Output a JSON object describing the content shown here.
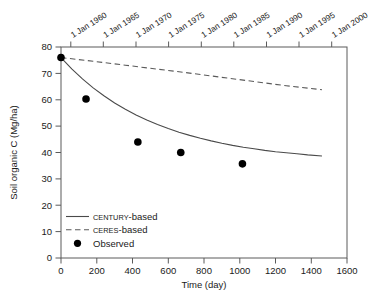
{
  "chart_data": {
    "type": "line",
    "title": "",
    "xlabel": "Time (day)",
    "ylabel": "Soil organic C (Mg/ha)",
    "xlim": [
      0,
      1600
    ],
    "ylim": [
      0,
      80
    ],
    "xticks": [
      0,
      200,
      400,
      600,
      800,
      1000,
      1200,
      1400,
      1600
    ],
    "yticks": [
      0,
      10,
      20,
      30,
      40,
      50,
      60,
      70,
      80
    ],
    "grid": false,
    "secondary_xaxis": {
      "label": "",
      "position": "top",
      "tick_labels": [
        "1 Jan 1960",
        "1 Jan 1965",
        "1 Jan 1970",
        "1 Jan 1975",
        "1 Jan 1980",
        "1 Jan 1985",
        "1 Jan 1990",
        "1 Jan 1995",
        "1 Jan 2000"
      ],
      "tick_days": [
        55,
        237,
        420,
        602,
        785,
        967,
        1150,
        1332,
        1515
      ]
    },
    "legend_position": "lower left",
    "series": [
      {
        "name": "CENTURY-based",
        "style": "solid",
        "x": [
          0,
          60,
          120,
          180,
          240,
          300,
          360,
          420,
          480,
          540,
          600,
          660,
          720,
          780,
          840,
          900,
          960,
          1020,
          1080,
          1140,
          1200,
          1260,
          1320,
          1380,
          1460
        ],
        "values": [
          76.0,
          71.7,
          67.9,
          64.5,
          61.5,
          58.8,
          56.4,
          54.2,
          52.3,
          50.6,
          49.1,
          47.7,
          46.5,
          45.4,
          44.4,
          43.5,
          42.7,
          42.0,
          41.4,
          40.8,
          40.3,
          39.9,
          39.5,
          39.1,
          38.7
        ]
      },
      {
        "name": "CERES-based",
        "style": "dashed",
        "x": [
          0,
          180,
          360,
          540,
          720,
          900,
          1080,
          1260,
          1460
        ],
        "values": [
          76.0,
          74.6,
          73.1,
          71.6,
          70.1,
          68.5,
          66.9,
          65.3,
          63.8
        ]
      },
      {
        "name": "Observed",
        "style": "markers",
        "x": [
          0,
          140,
          430,
          670,
          1015
        ],
        "values": [
          76.0,
          60.3,
          44.0,
          40.0,
          35.7
        ]
      }
    ],
    "legend": [
      {
        "label_small_caps": "CENTURY",
        "label_rest": "-based",
        "marker": "solid-line"
      },
      {
        "label_small_caps": "CERES",
        "label_rest": "-based",
        "marker": "dashed-line"
      },
      {
        "label_small_caps": "",
        "label_rest": "Observed",
        "marker": "filled-circle"
      }
    ],
    "colors": {
      "axis": "#5a5a5a",
      "curve_solid": "#4a4a4a",
      "curve_dashed": "#5a5a5a",
      "marker": "#000000",
      "background": "#ffffff"
    }
  }
}
